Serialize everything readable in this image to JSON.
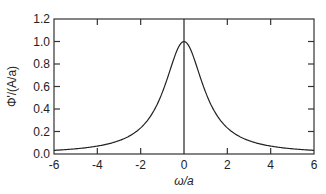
{
  "chart_data": {
    "type": "line",
    "title": "",
    "xlabel": "ω/a",
    "ylabel": "Φ'/(A/a)",
    "xlim": [
      -6,
      6
    ],
    "ylim": [
      0,
      1.2
    ],
    "xticks": [
      -6,
      -4,
      -2,
      0,
      2,
      4,
      6
    ],
    "yticks": [
      0.0,
      0.2,
      0.4,
      0.6,
      0.8,
      1.0,
      1.2
    ],
    "xtick_labels": [
      "-6",
      "-4",
      "-2",
      "0",
      "2",
      "4",
      "6"
    ],
    "ytick_labels": [
      "0.0",
      "0.2",
      "0.4",
      "0.6",
      "0.8",
      "1.0",
      "1.2"
    ],
    "grid": false,
    "legend": null,
    "vertical_line_at_x": 0,
    "series": [
      {
        "name": "Lorentzian",
        "x": [
          -6,
          -5,
          -4,
          -3,
          -2,
          -1.5,
          -1,
          -0.5,
          0,
          0.5,
          1,
          1.5,
          2,
          3,
          4,
          5,
          6
        ],
        "y": [
          0.033,
          0.046,
          0.07,
          0.118,
          0.232,
          0.35,
          0.548,
          0.829,
          1.0,
          0.829,
          0.548,
          0.35,
          0.232,
          0.118,
          0.07,
          0.046,
          0.033
        ]
      }
    ]
  }
}
